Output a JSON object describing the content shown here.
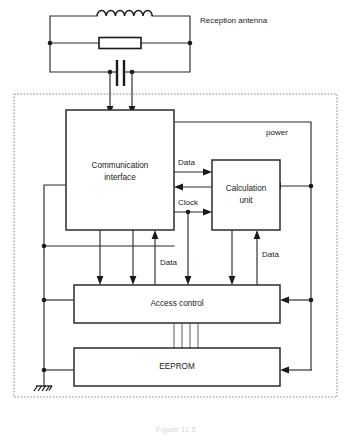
{
  "figure": {
    "caption": "Figure 11.5",
    "caption_visible": "partially cropped at bottom edge"
  },
  "antenna": {
    "label": "Reception antenna",
    "components": [
      {
        "name": "inductor",
        "symbol": "coil"
      },
      {
        "name": "resistor",
        "symbol": "rectangle"
      },
      {
        "name": "capacitor",
        "symbol": "parallel-plates"
      }
    ]
  },
  "chip": {
    "boundary": "dashed",
    "power_label": "power"
  },
  "blocks": [
    {
      "id": "communication-interface",
      "label": "Communication\ninterface",
      "line1": "Communication",
      "line2": "interface"
    },
    {
      "id": "calculation-unit",
      "label": "Calculation\nunit",
      "line1": "Calculation",
      "line2": "unit"
    },
    {
      "id": "access-control",
      "label": "Access control"
    },
    {
      "id": "eeprom",
      "label": "EEPROM"
    }
  ],
  "signals": {
    "data_top": "Data",
    "clock": "Clock",
    "data_mid_left": "Data",
    "data_mid_right": "Data"
  },
  "colors": {
    "line": "#2b2b2b",
    "boundary": "#8a8a8a",
    "text": "#1a1a1a",
    "background": "#ffffff"
  }
}
